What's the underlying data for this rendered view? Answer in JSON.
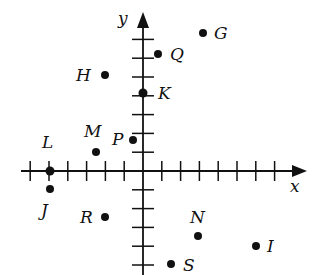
{
  "diagram": {
    "type": "coordinate-plane",
    "axes": {
      "x_label": "x",
      "y_label": "y",
      "origin_px": [
        143,
        171
      ],
      "unit_px": 18.8,
      "x_ticks": [
        -6,
        -5,
        -4,
        -3,
        -2,
        -1,
        1,
        2,
        3,
        4,
        5,
        6,
        7
      ],
      "y_ticks": [
        -5,
        -4,
        -3,
        -2,
        -1,
        1,
        2,
        3,
        4,
        5,
        6,
        7
      ],
      "x_range_px": [
        21,
        305
      ],
      "y_range_px": [
        14,
        275
      ]
    },
    "points": [
      {
        "name": "G",
        "px": [
          203,
          33
        ],
        "label_px": [
          214,
          39
        ]
      },
      {
        "name": "Q",
        "px": [
          158,
          54
        ],
        "label_px": [
          170,
          60
        ]
      },
      {
        "name": "H",
        "px": [
          105,
          75
        ],
        "label_px": [
          76,
          81
        ]
      },
      {
        "name": "K",
        "px": [
          143,
          93
        ],
        "label_px": [
          158,
          99
        ]
      },
      {
        "name": "P",
        "px": [
          133,
          140
        ],
        "label_px": [
          112,
          145
        ]
      },
      {
        "name": "M",
        "px": [
          96,
          152
        ],
        "label_px": [
          85,
          136
        ]
      },
      {
        "name": "L",
        "px": [
          50,
          171
        ],
        "label_px": [
          42,
          145
        ]
      },
      {
        "name": "J",
        "px": [
          50,
          188
        ],
        "label_px": [
          41,
          216
        ]
      },
      {
        "name": "R",
        "px": [
          105,
          217
        ],
        "label_px": [
          80,
          222
        ]
      },
      {
        "name": "N",
        "px": [
          198,
          236
        ],
        "label_px": [
          189,
          222
        ]
      },
      {
        "name": "I",
        "px": [
          256,
          245
        ],
        "label_px": [
          268,
          251
        ]
      },
      {
        "name": "S",
        "px": [
          171,
          264
        ],
        "label_px": [
          184,
          271
        ]
      }
    ]
  },
  "labels": {
    "x": "x",
    "y": "y",
    "G": "G",
    "Q": "Q",
    "H": "H",
    "K": "K",
    "P": "P",
    "M": "M",
    "L": "L",
    "J": "J",
    "R": "R",
    "N": "N",
    "I": "I",
    "S": "S"
  }
}
